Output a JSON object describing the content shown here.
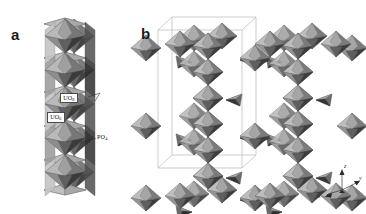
{
  "figure": {
    "type": "crystal-structure-figure",
    "background_color": "#ffffff",
    "rendering": "grayscale polyhedral model",
    "panels": [
      {
        "letter": "a",
        "name": "panel-a",
        "description": "Single infinite chain of edge-sharing uranium-oxygen polyhedra decorated by phosphate tetrahedra, viewed perpendicular to the chain axis",
        "annotations": [
          {
            "name": "uo8-label",
            "text": "UO",
            "subscript": "8",
            "boxed": true
          },
          {
            "name": "uo6-label",
            "text": "UO",
            "subscript": "6",
            "boxed": true
          },
          {
            "name": "po4-label",
            "text": "PO",
            "subscript": "4",
            "boxed": false
          }
        ]
      },
      {
        "letter": "b",
        "name": "panel-b",
        "description": "Three-dimensional framework built from the chains shown in (a), with the unit-cell outline drawn as a thin grey box",
        "unit_cell_outline": true,
        "axis_triad": {
          "name": "axis-triad",
          "axes": [
            "z",
            "y",
            "x"
          ],
          "z_label": "z",
          "y_label": "y",
          "x_label": "x"
        }
      }
    ],
    "colors": {
      "background": "#ffffff",
      "polyhedron_light": "#c9c9c9",
      "polyhedron_mid": "#9a9a9a",
      "polyhedron_dark": "#6b6b6b",
      "polyhedron_darkest": "#2f2f2f",
      "edge": "#555555",
      "unit_cell_line": "#b4b4b4",
      "label_text": "#111111",
      "panel_letter": "#1b1b1b"
    }
  }
}
